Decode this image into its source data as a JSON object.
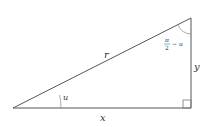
{
  "diagram": {
    "type": "right-triangle",
    "colors": {
      "stroke": "#555555",
      "text": "#333333",
      "background": "#ffffff"
    },
    "labels": {
      "hypotenuse": "r",
      "base": "x",
      "height": "y",
      "angle_bottom_left": "u",
      "angle_top_right_num": "π",
      "angle_top_right_den": "2",
      "angle_top_right_suffix": "− u"
    },
    "right_angle_marker": "bottom-right"
  }
}
